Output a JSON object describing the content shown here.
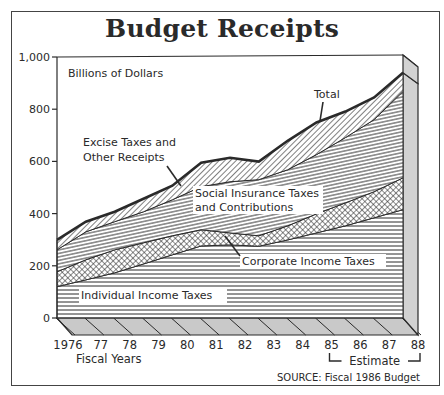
{
  "title": "Budget Receipts",
  "unit_label": "Billions of Dollars",
  "x_axis_title": "Fiscal Years",
  "estimate_label": "Estimate",
  "source": "SOURCE: Fiscal 1986 Budget",
  "layer_labels": {
    "total": "Total",
    "excise": [
      "Excise Taxes and",
      "Other Receipts"
    ],
    "social": [
      "Social Insurance Taxes",
      "and Contributions"
    ],
    "corporate": "Corporate Income Taxes",
    "individual": "Individual Income Taxes"
  },
  "colors": {
    "ink": "#2a2a2a",
    "floor": "#c9c9c9",
    "side": "#d2d2d2",
    "background": "#ffffff"
  },
  "chart_data": {
    "type": "area",
    "stacked": true,
    "title": "Budget Receipts",
    "xlabel": "Fiscal Years",
    "ylabel": "Billions of Dollars",
    "categories": [
      "1976",
      "77",
      "78",
      "79",
      "80",
      "81",
      "82",
      "83",
      "84",
      "85",
      "86",
      "87",
      "88"
    ],
    "ylim": [
      0,
      1000
    ],
    "yticks": [
      0,
      200,
      400,
      600,
      800,
      1000
    ],
    "ytick_labels": [
      "0",
      "200",
      "400",
      "600",
      "800",
      "1,000"
    ],
    "estimate_range": [
      "85",
      "88"
    ],
    "grid": false,
    "legend": "inline labels",
    "series": [
      {
        "name": "Individual Income Taxes",
        "pattern": "horizontal-lines",
        "values": [
          120,
          146,
          173,
          207,
          242,
          276,
          280,
          275,
          299,
          326,
          353,
          384,
          415
        ]
      },
      {
        "name": "Corporate Income Taxes",
        "pattern": "crosshatch",
        "values": [
          57,
          77,
          88,
          81,
          73,
          62,
          46,
          40,
          54,
          73,
          88,
          100,
          122
        ]
      },
      {
        "name": "Social Insurance Taxes and Contributions",
        "pattern": "horizontal-lines",
        "values": [
          84,
          107,
          108,
          119,
          138,
          165,
          196,
          215,
          215,
          227,
          250,
          276,
          331
        ]
      },
      {
        "name": "Excise Taxes and Other Receipts",
        "pattern": "diagonal-lines",
        "values": [
          38,
          39,
          38,
          50,
          54,
          92,
          92,
          69,
          111,
          123,
          100,
          85,
          72
        ]
      }
    ],
    "totals": [
      299,
      369,
      407,
      457,
      507,
      595,
      614,
      599,
      679,
      749,
      791,
      845,
      940
    ]
  }
}
